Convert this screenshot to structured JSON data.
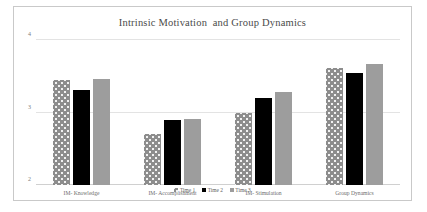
{
  "chart_data": {
    "type": "bar",
    "title": "Intrinsic Motivation  and Group Dynamics",
    "xlabel": "",
    "ylabel": "",
    "ylim": [
      2,
      4
    ],
    "yticks": [
      "2",
      "3",
      "4"
    ],
    "grid": true,
    "legend_position": "bottom",
    "categories": [
      "IM- Knowledge",
      "IM- Accomplishment",
      "IM- Stimulation",
      "Group Dynamics"
    ],
    "series": [
      {
        "name": "Time 1",
        "color": "#8d8d8d",
        "pattern": "dotted",
        "values": [
          3.45,
          2.7,
          2.99,
          3.62
        ]
      },
      {
        "name": "Time 2",
        "color": "#000000",
        "pattern": "solid",
        "values": [
          3.32,
          2.9,
          3.2,
          3.55
        ]
      },
      {
        "name": "Time 3",
        "color": "#9d9d9d",
        "pattern": "solid",
        "values": [
          3.46,
          2.91,
          3.28,
          3.68
        ]
      }
    ]
  }
}
